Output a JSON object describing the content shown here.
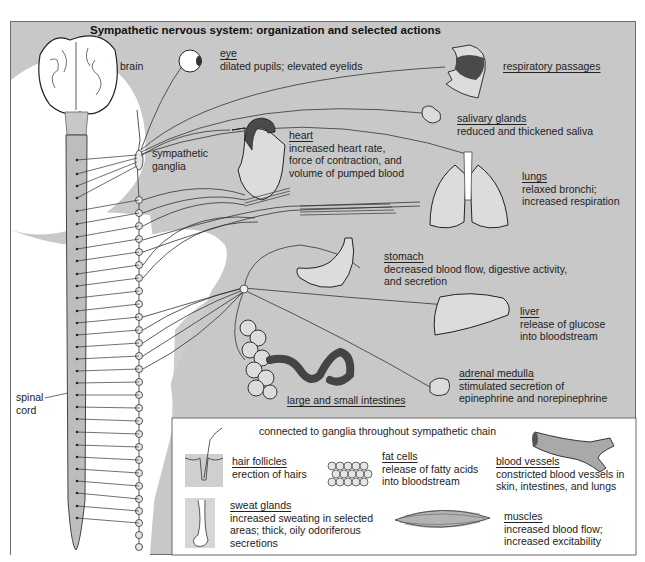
{
  "title": "Sympathetic nervous system: organization and selected actions",
  "structures": {
    "brain": "brain",
    "sympathetic_ganglia": [
      "sympathetic",
      "ganglia"
    ],
    "spinal_cord": [
      "spinal",
      "cord"
    ]
  },
  "organs": {
    "eye": {
      "name": "eye",
      "lines": [
        "dilated pupils; elevated eyelids"
      ]
    },
    "respiratory": {
      "name": "respiratory passages",
      "lines": []
    },
    "salivary": {
      "name": "salivary glands",
      "lines": [
        "reduced and thickened saliva"
      ]
    },
    "heart": {
      "name": "heart",
      "lines": [
        "increased heart rate,",
        "force of contraction, and",
        "volume of pumped blood"
      ]
    },
    "lungs": {
      "name": "lungs",
      "lines": [
        "relaxed bronchi;",
        "increased respiration"
      ]
    },
    "stomach": {
      "name": "stomach",
      "lines": [
        "decreased blood flow, digestive activity,",
        "and secretion"
      ]
    },
    "liver": {
      "name": "liver",
      "lines": [
        "release of glucose",
        "into bloodstream"
      ]
    },
    "adrenal": {
      "name": "adrenal medulla",
      "lines": [
        "stimulated secretion of",
        "epinephrine and norepinephrine"
      ]
    },
    "intestines": {
      "name": "large and small intestines",
      "lines": []
    }
  },
  "inset": {
    "heading": "connected to ganglia throughout sympathetic chain",
    "items": {
      "hair": {
        "name": "hair follicles",
        "lines": [
          "erection of hairs"
        ]
      },
      "fat": {
        "name": "fat cells",
        "lines": [
          "release of fatty acids",
          "into bloodstream"
        ]
      },
      "vessels": {
        "name": "blood vessels",
        "lines": [
          "constricted blood vessels in",
          "skin, intestines, and lungs"
        ]
      },
      "sweat": {
        "name": "sweat glands",
        "lines": [
          "increased sweating in selected",
          "areas; thick, oily odoriferous",
          "secretions"
        ]
      },
      "muscles": {
        "name": "muscles",
        "lines": [
          "increased blood flow;",
          "increased excitability"
        ]
      }
    }
  },
  "colors": {
    "background": "#c8c8c8",
    "body_silhouette": "#ffffff",
    "organ_fill": "#dcdcdc",
    "dark_accent": "#4a4a4a",
    "line": "#333333"
  }
}
